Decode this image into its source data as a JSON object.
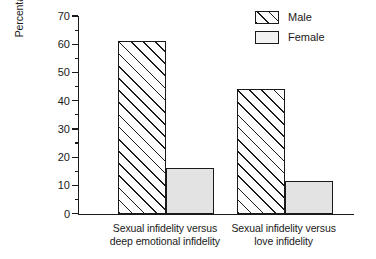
{
  "chart_data": {
    "type": "bar",
    "title": "",
    "subtitle": "",
    "xlabel": "",
    "ylabel": "Percentage reporting more distress to sexual infidelity",
    "ylabel_lines": [
      "Percentage reporting more distress",
      "to sexual infidelity"
    ],
    "categories": [
      "Sexual infidelity versus deep emotional infidelity",
      "Sexual infidelity versus love infidelity"
    ],
    "category_label_lines": [
      [
        "Sexual infidelity versus",
        "deep emotional infidelity"
      ],
      [
        "Sexual infidelity versus",
        "love infidelity"
      ]
    ],
    "series": [
      {
        "name": "Male",
        "values": [
          61,
          44
        ]
      },
      {
        "name": "Female",
        "values": [
          16,
          11.5
        ]
      }
    ],
    "ylim": [
      0,
      70
    ],
    "y_major_ticks": [
      0,
      10,
      20,
      30,
      40,
      50,
      60,
      70
    ],
    "y_minor_ticks": [
      5,
      15,
      25,
      35,
      45,
      55,
      65
    ],
    "y_tick_labels": [
      "0",
      "10",
      "20",
      "30",
      "40",
      "50",
      "60",
      "70"
    ],
    "grid": false,
    "legend_position": "top-right",
    "colors": {
      "male_fill": "#fdfdfd",
      "male_hatch": "#1a1a1a",
      "female_fill": "#e3e3e3",
      "axis": "#1a1a1a",
      "text": "#1a1a1a",
      "background": "#ffffff"
    }
  },
  "legend": {
    "items": [
      {
        "label": "Male",
        "swatch": "hatched-swatch-icon"
      },
      {
        "label": "Female",
        "swatch": "solid-swatch-icon"
      }
    ]
  }
}
